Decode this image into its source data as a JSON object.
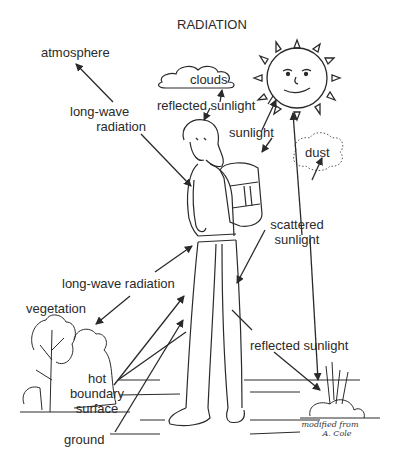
{
  "title": "RADIATION",
  "labels": {
    "atmosphere": "atmosphere",
    "longwave_top_1": "long-wave",
    "longwave_top_2": "radiation",
    "clouds": "clouds",
    "reflected_sunlight_top": "reflected sunlight",
    "sunlight": "sunlight",
    "dust": "dust",
    "scattered_1": "scattered",
    "scattered_2": "sunlight",
    "longwave_mid": "long-wave radiation",
    "vegetation": "vegetation",
    "reflected_sunlight_bottom": "reflected sunlight",
    "hot_1": "hot",
    "hot_2": "boundary",
    "hot_3": "surface",
    "ground": "ground"
  },
  "credit": {
    "line1": "modified from",
    "line2": "A. Cole"
  },
  "colors": {
    "ink": "#2a2a2a",
    "background": "#ffffff"
  }
}
